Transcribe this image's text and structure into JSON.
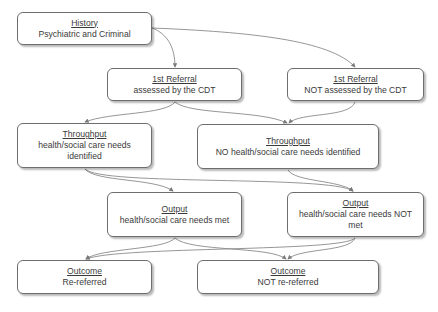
{
  "diagram": {
    "nodes": {
      "history": {
        "title": "History",
        "text": "Psychiatric and Criminal"
      },
      "referral_assessed": {
        "title": "1st Referral",
        "text": "assessed by the CDT"
      },
      "referral_not_assessed": {
        "title": "1st Referral",
        "text": "NOT assessed by the CDT"
      },
      "throughput_needs": {
        "title": "Throughput",
        "text": "health/social care needs identified"
      },
      "throughput_no_needs": {
        "title": "Throughput",
        "text": "NO health/social care needs identified"
      },
      "output_met": {
        "title": "Output",
        "text": "health/social care needs met"
      },
      "output_not_met": {
        "title": "Output",
        "text": "health/social care needs NOT met"
      },
      "outcome_rereferred": {
        "title": "Outcome",
        "text": "Re-referred"
      },
      "outcome_not_rereferred": {
        "title": "Outcome",
        "text": "NOT re-referred"
      }
    },
    "edges": [
      [
        "history",
        "referral_assessed"
      ],
      [
        "history",
        "referral_not_assessed"
      ],
      [
        "referral_assessed",
        "throughput_needs"
      ],
      [
        "referral_assessed",
        "throughput_no_needs"
      ],
      [
        "referral_not_assessed",
        "throughput_no_needs"
      ],
      [
        "throughput_needs",
        "output_met"
      ],
      [
        "throughput_needs",
        "output_not_met"
      ],
      [
        "throughput_no_needs",
        "output_not_met"
      ],
      [
        "output_met",
        "outcome_rereferred"
      ],
      [
        "output_met",
        "outcome_not_rereferred"
      ],
      [
        "output_not_met",
        "outcome_rereferred"
      ],
      [
        "output_not_met",
        "outcome_not_rereferred"
      ]
    ],
    "colors": {
      "border": "#6e6e6e",
      "text": "#3a3a3a",
      "connector": "#8a8a8a"
    }
  }
}
